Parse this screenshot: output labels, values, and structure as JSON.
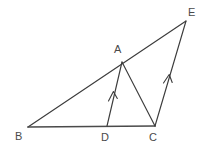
{
  "figure": {
    "background_color": "#ffffff",
    "stroke_color": "#3c3c3c",
    "base_stroke_color": "#4a4a4a",
    "label_color": "#4a4a4a",
    "canvas": {
      "width": 209,
      "height": 154
    },
    "points": [
      {
        "id": "B",
        "label": "B",
        "x": 28,
        "y": 127,
        "label_x": 15,
        "label_y": 131
      },
      {
        "id": "D",
        "label": "D",
        "x": 107,
        "y": 126,
        "label_x": 101,
        "label_y": 132
      },
      {
        "id": "C",
        "label": "C",
        "x": 155,
        "y": 126,
        "label_x": 149,
        "label_y": 132
      },
      {
        "id": "A",
        "label": "A",
        "x": 122,
        "y": 62,
        "label_x": 114,
        "label_y": 44
      },
      {
        "id": "E",
        "label": "E",
        "x": 186,
        "y": 21,
        "label_x": 188,
        "label_y": 7
      }
    ],
    "segments": [
      {
        "id": "BE",
        "from": "B",
        "to": "E",
        "style": "plain",
        "note": "long line through A"
      },
      {
        "id": "BC",
        "from": "B",
        "to": "C",
        "style": "base",
        "note": "baseline, drawn heavier"
      },
      {
        "id": "DA",
        "from": "D",
        "to": "A",
        "style": "single-arrow"
      },
      {
        "id": "AC",
        "from": "A",
        "to": "C",
        "style": "plain"
      },
      {
        "id": "CE",
        "from": "C",
        "to": "E",
        "style": "single-arrow"
      }
    ],
    "tick_marks": [
      {
        "id": "arrow-on-DA",
        "on_segment": "DA",
        "x": 113,
        "y": 95,
        "kind": "single-chevron",
        "meaning": "parallel mark"
      },
      {
        "id": "arrow-on-CE",
        "on_segment": "CE",
        "x": 168,
        "y": 78,
        "kind": "single-chevron",
        "meaning": "parallel mark"
      }
    ],
    "relations": [
      "DA is parallel to CE (single arrow marks)",
      "B, A, E are collinear",
      "B, D, C are collinear"
    ]
  }
}
